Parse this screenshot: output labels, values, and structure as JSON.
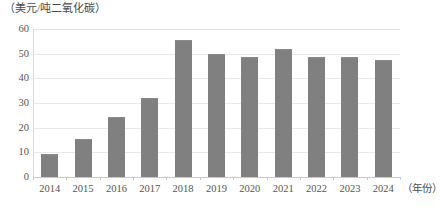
{
  "chart_data": {
    "type": "bar",
    "title": "",
    "subtitle": "",
    "unit_caption": "（美元/吨二氧化碳）",
    "xlabel": "（年份）",
    "ylabel": "",
    "categories": [
      "2014",
      "2015",
      "2016",
      "2017",
      "2018",
      "2019",
      "2020",
      "2021",
      "2022",
      "2023",
      "2024"
    ],
    "values": [
      9.5,
      15.5,
      24.5,
      32,
      55.5,
      50,
      48.5,
      52,
      48.5,
      48.5,
      47.5
    ],
    "ylim": [
      0,
      60
    ],
    "yticks": [
      0,
      10,
      20,
      30,
      40,
      50,
      60
    ],
    "ytick_labels": [
      "0",
      "10",
      "20",
      "30",
      "40",
      "50",
      "60"
    ],
    "grid": true,
    "legend": "none",
    "bar_color": "#808080",
    "grid_color": "#e9e9e9",
    "axis_color": "#c9c9c9",
    "background": "#ffffff"
  }
}
